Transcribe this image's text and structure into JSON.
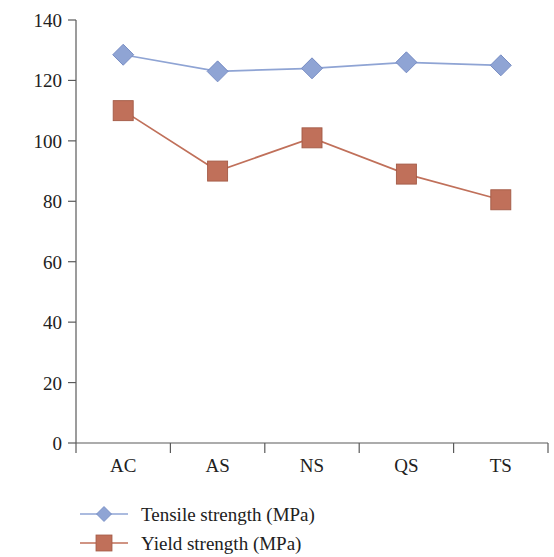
{
  "chart_data": {
    "type": "line",
    "title": "",
    "subtitle": "",
    "xlabel": "",
    "ylabel": "",
    "categories": [
      "AC",
      "AS",
      "NS",
      "QS",
      "TS"
    ],
    "series": [
      {
        "name": "Tensile strength (MPa)",
        "values": [
          128.5,
          123,
          124,
          126,
          125
        ],
        "color": "#8fa4d4",
        "marker": "diamond"
      },
      {
        "name": "Yield  strength (MPa)",
        "values": [
          110,
          90,
          101,
          89,
          80.5
        ],
        "color": "#c0705a",
        "marker": "square"
      }
    ],
    "ylim": [
      0,
      140
    ],
    "ytick_step": 20,
    "yticks": [
      "0",
      "20",
      "40",
      "60",
      "80",
      "100",
      "120",
      "140"
    ],
    "grid": false,
    "legend_position": "bottom-left"
  },
  "axes": {
    "y_axis_name": "y-axis",
    "x_axis_name": "x-axis"
  },
  "legend": {
    "entries": [
      {
        "label": "Tensile strength (MPa)",
        "marker": "diamond",
        "color": "#8fa4d4"
      },
      {
        "label": "Yield  strength (MPa)",
        "marker": "square",
        "color": "#c0705a"
      }
    ]
  }
}
